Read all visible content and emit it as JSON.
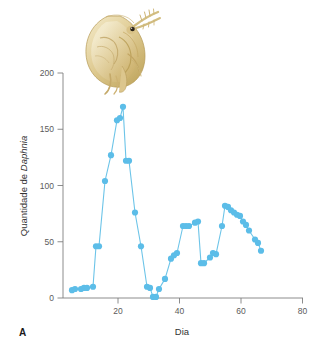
{
  "figure": {
    "panel_label": "A",
    "illustration": "daphnia-illustration"
  },
  "axes": {
    "x_title": "Dia",
    "y_title_prefix": "Quantidade de ",
    "y_title_italic": "Daphnia",
    "x_ticks": [
      "20",
      "40",
      "60",
      "80"
    ],
    "y_ticks": [
      "0",
      "50",
      "100",
      "150",
      "200"
    ]
  },
  "colors": {
    "marker": "#5cbde8",
    "line": "#6cc4e8",
    "axis": "#7f7f7f",
    "tick_text": "#5b5b5b",
    "title_text": "#333333",
    "background": "#ffffff"
  },
  "chart_data": {
    "type": "line",
    "title": "",
    "xlabel": "Dia",
    "ylabel": "Quantidade de Daphnia",
    "xlim": [
      0,
      80
    ],
    "ylim": [
      0,
      200
    ],
    "x_ticks": [
      20,
      40,
      60,
      80
    ],
    "y_ticks": [
      0,
      50,
      100,
      150,
      200
    ],
    "grid": false,
    "legend": "none",
    "markers": true,
    "series": [
      {
        "name": "Quantidade de Daphnia",
        "x": [
          3,
          4,
          6,
          7,
          8,
          10,
          11,
          12,
          14,
          16,
          18,
          19,
          20,
          21,
          22,
          24,
          26,
          28,
          29,
          30,
          31,
          32,
          34,
          36,
          37,
          38,
          40,
          41,
          42,
          44,
          45,
          46,
          47,
          49,
          50,
          51,
          53,
          54,
          55,
          56,
          57,
          58,
          59,
          60,
          61,
          62,
          64,
          65,
          66
        ],
        "y": [
          7,
          8,
          8,
          9,
          9,
          10,
          46,
          46,
          104,
          127,
          158,
          160,
          170,
          122,
          122,
          76,
          46,
          10,
          9,
          1,
          1,
          8,
          17,
          35,
          38,
          40,
          64,
          64,
          64,
          67,
          68,
          31,
          31,
          36,
          40,
          39,
          64,
          82,
          81,
          78,
          76,
          74,
          73,
          68,
          65,
          60,
          52,
          49,
          42
        ]
      }
    ]
  }
}
